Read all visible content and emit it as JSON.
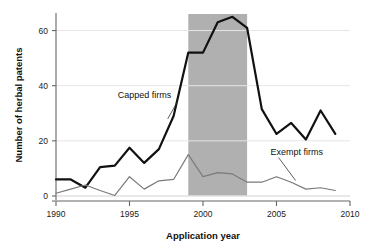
{
  "chart_data": {
    "type": "line",
    "title": "",
    "xlabel": "Application year",
    "ylabel": "Number of herbal patents",
    "xlim": [
      1990,
      2010
    ],
    "ylim": [
      0,
      66
    ],
    "xticks": [
      1990,
      1995,
      2000,
      2005,
      2010
    ],
    "xtick_labels": [
      "1990",
      "1995",
      "2000",
      "2005",
      "2010"
    ],
    "yticks": [
      0,
      20,
      40,
      60
    ],
    "ytick_labels": [
      "0",
      "20",
      "40",
      "60"
    ],
    "grid": "horizontal",
    "legend_position": "inline-annotations",
    "x": [
      1990,
      1991,
      1992,
      1993,
      1994,
      1995,
      1996,
      1997,
      1998,
      1999,
      2000,
      2001,
      2002,
      2003,
      2004,
      2005,
      2006,
      2007,
      2008,
      2009
    ],
    "series": [
      {
        "name": "Capped firms",
        "color": "#111111",
        "line_width": 2.2,
        "values": [
          6,
          6,
          3,
          10.5,
          11,
          17.5,
          12,
          17,
          29,
          52,
          52,
          63,
          65,
          61,
          31.5,
          22.5,
          26.5,
          20.5,
          31,
          22.5
        ]
      },
      {
        "name": "Exempt firms",
        "color": "#7a7a7a",
        "line_width": 1.2,
        "values": [
          1,
          2.5,
          4,
          2,
          0.2,
          7,
          2.5,
          5.5,
          6,
          15,
          7,
          8.5,
          8,
          5,
          5,
          7,
          5,
          2.5,
          3,
          2
        ]
      }
    ],
    "shaded_region": {
      "label": "",
      "x_start": 1999,
      "x_end": 2003,
      "y_start": 0,
      "y_end": 66,
      "color": "#b0b0b0"
    },
    "annotations": [
      {
        "name": "capped-firms-label",
        "text": "Capped firms",
        "x": 1994.2,
        "y": 35.5,
        "leader_to_x": 1997.6,
        "leader_to_y": 28.0
      },
      {
        "name": "exempt-firms-label",
        "text": "Exempt firms",
        "x": 2004.6,
        "y": 15.0,
        "leader_to_x": 2006.3,
        "leader_to_y": 5.6
      }
    ],
    "axis_color": "#666666",
    "grid_color": "#e6e6e6",
    "background": "#ffffff"
  }
}
